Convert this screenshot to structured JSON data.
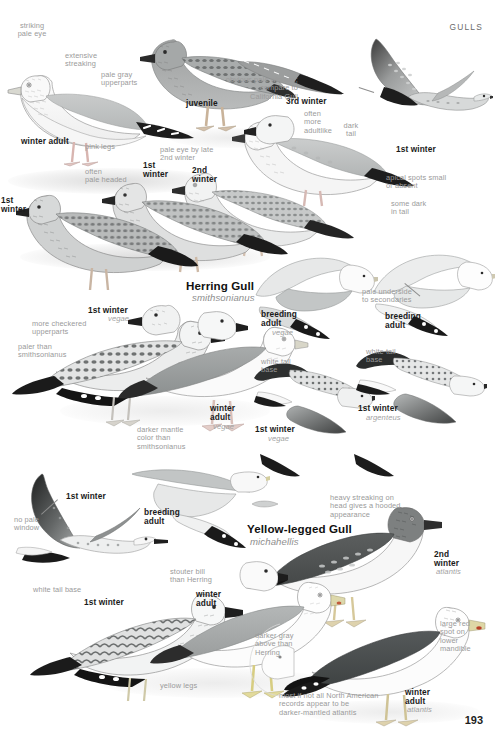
{
  "page": {
    "header": "GULLS",
    "number": "193",
    "background_color": "#ffffff",
    "text_gray": "#9a9a9a",
    "text_black": "#1a1a1a"
  },
  "species": [
    {
      "common_name": "Herring Gull",
      "scientific_name": "smithsonianus",
      "x": 186,
      "y": 279
    },
    {
      "common_name": "Yellow-legged Gull",
      "scientific_name": "michahellis",
      "x": 247,
      "y": 522
    }
  ],
  "plate_labels": [
    {
      "id": "striking-pale-eye",
      "text": "striking\npale eye",
      "x": 32,
      "y": 22,
      "style": "gray",
      "align": "center"
    },
    {
      "id": "extensive-streaking",
      "text": "extensive\nstreaking",
      "x": 65,
      "y": 52,
      "style": "gray",
      "align": "left"
    },
    {
      "id": "pale-gray-upperparts",
      "text": "pale gray\nupperparts",
      "x": 101,
      "y": 71,
      "style": "gray",
      "align": "left"
    },
    {
      "id": "winter-adult-1",
      "text": "winter adult",
      "x": 21,
      "y": 137,
      "style": "bold",
      "align": "left"
    },
    {
      "id": "pink-legs",
      "text": "pink legs",
      "x": 85,
      "y": 143,
      "style": "gray",
      "align": "left"
    },
    {
      "id": "juvenile",
      "text": "juvenile",
      "x": 186,
      "y": 99,
      "style": "bold",
      "align": "left"
    },
    {
      "id": "third-winter",
      "text": "3rd winter",
      "x": 286,
      "y": 97,
      "style": "bold",
      "align": "left"
    },
    {
      "id": "often-more-adultlike",
      "text": "often\nmore\nadultlike",
      "x": 304,
      "y": 110,
      "style": "gray",
      "align": "left"
    },
    {
      "id": "obvious-pale-window",
      "text": "obvious pale window;\ncompare to\nCalifornia Gull",
      "x": 298,
      "y": 76,
      "style": "gray",
      "align": "right"
    },
    {
      "id": "dark-tail",
      "text": "dark\ntail",
      "x": 351,
      "y": 122,
      "style": "gray",
      "align": "center"
    },
    {
      "id": "first-winter-flight-top",
      "text": "1st winter",
      "x": 396,
      "y": 145,
      "style": "bold",
      "align": "left"
    },
    {
      "id": "apical-spots",
      "text": "apical spots small\nor absent",
      "x": 386,
      "y": 174,
      "style": "gray",
      "align": "left"
    },
    {
      "id": "some-dark-in-tail",
      "text": "some dark\nin tail",
      "x": 391,
      "y": 200,
      "style": "gray",
      "align": "left"
    },
    {
      "id": "pale-eye-by-late",
      "text": "pale eye by late\n2nd winter",
      "x": 160,
      "y": 146,
      "style": "gray",
      "align": "left"
    },
    {
      "id": "first-winter-b",
      "text": "1st\nwinter",
      "x": 143,
      "y": 161,
      "style": "bold",
      "align": "left"
    },
    {
      "id": "second-winter-b",
      "text": "2nd\nwinter",
      "x": 192,
      "y": 166,
      "style": "bold",
      "align": "left"
    },
    {
      "id": "often-pale-headed",
      "text": "often\npale headed",
      "x": 85,
      "y": 168,
      "style": "gray",
      "align": "left"
    },
    {
      "id": "first-winter-left",
      "text": "1st\nwinter",
      "x": 1,
      "y": 196,
      "style": "bold",
      "align": "left"
    },
    {
      "id": "first-winter-vegae-a",
      "text": "1st winter",
      "x": 88,
      "y": 306,
      "style": "bold",
      "align": "left"
    },
    {
      "id": "vegae-a",
      "text": "vegae",
      "x": 108,
      "y": 315,
      "style": "sci",
      "align": "left"
    },
    {
      "id": "more-checkered",
      "text": "more checkered\nupperparts",
      "x": 32,
      "y": 320,
      "style": "gray",
      "align": "left"
    },
    {
      "id": "paler-than-smith",
      "text": "paler than\nsmithsonianus",
      "x": 18,
      "y": 343,
      "style": "gray",
      "align": "left"
    },
    {
      "id": "winter-adult-vegae",
      "text": "winter\nadult",
      "x": 210,
      "y": 404,
      "style": "bold",
      "align": "left"
    },
    {
      "id": "vegae-b",
      "text": "vegae",
      "x": 213,
      "y": 423,
      "style": "sci",
      "align": "left"
    },
    {
      "id": "darker-mantle-color",
      "text": "darker mantle\ncolor than\nsmithsonianus",
      "x": 137,
      "y": 426,
      "style": "gray",
      "align": "left"
    },
    {
      "id": "breeding-adult-vegae",
      "text": "breeding\nadult",
      "x": 261,
      "y": 310,
      "style": "bold",
      "align": "left"
    },
    {
      "id": "vegae-c",
      "text": "vegae",
      "x": 272,
      "y": 329,
      "style": "sci",
      "align": "left"
    },
    {
      "id": "pale-underside-sec",
      "text": "pale underside\nto secondaries",
      "x": 362,
      "y": 288,
      "style": "gray",
      "align": "left"
    },
    {
      "id": "breeding-adult-argenteus",
      "text": "breeding\nadult",
      "x": 385,
      "y": 312,
      "style": "bold",
      "align": "left"
    },
    {
      "id": "white-tail-base-a",
      "text": "white tail\nbase",
      "x": 261,
      "y": 358,
      "style": "gray",
      "align": "left"
    },
    {
      "id": "first-winter-vegae-b",
      "text": "1st winter",
      "x": 255,
      "y": 425,
      "style": "bold",
      "align": "left"
    },
    {
      "id": "vegae-d",
      "text": "vegae",
      "x": 268,
      "y": 435,
      "style": "sci",
      "align": "left"
    },
    {
      "id": "white-tail-base-b",
      "text": "white tail\nbase",
      "x": 366,
      "y": 348,
      "style": "gray",
      "align": "left"
    },
    {
      "id": "first-winter-argenteus",
      "text": "1st winter",
      "x": 358,
      "y": 404,
      "style": "bold",
      "align": "left"
    },
    {
      "id": "argenteus",
      "text": "argenteus",
      "x": 366,
      "y": 414,
      "style": "sci",
      "align": "left"
    },
    {
      "id": "first-winter-flight-low",
      "text": "1st winter",
      "x": 66,
      "y": 492,
      "style": "bold",
      "align": "left"
    },
    {
      "id": "no-pale-window",
      "text": "no pale\nwindow",
      "x": 14,
      "y": 516,
      "style": "gray",
      "align": "left"
    },
    {
      "id": "white-tail-base-c",
      "text": "white tail base",
      "x": 33,
      "y": 586,
      "style": "gray",
      "align": "left"
    },
    {
      "id": "breeding-adult-ylg",
      "text": "breeding\nadult",
      "x": 144,
      "y": 508,
      "style": "bold",
      "align": "left"
    },
    {
      "id": "heavy-streaking-head",
      "text": "heavy streaking on\nhead gives a hooded\nappearance",
      "x": 330,
      "y": 494,
      "style": "gray",
      "align": "left"
    },
    {
      "id": "second-winter-atlantis",
      "text": "2nd\nwinter",
      "x": 434,
      "y": 550,
      "style": "bold",
      "align": "left"
    },
    {
      "id": "atlantis-a",
      "text": "atlantis",
      "x": 436,
      "y": 568,
      "style": "sci",
      "align": "left"
    },
    {
      "id": "stouter-bill",
      "text": "stouter bill\nthan Herring",
      "x": 170,
      "y": 568,
      "style": "gray",
      "align": "left"
    },
    {
      "id": "first-winter-ylg",
      "text": "1st winter",
      "x": 84,
      "y": 598,
      "style": "bold",
      "align": "left"
    },
    {
      "id": "winter-adult-ylg-a",
      "text": "winter\nadult",
      "x": 196,
      "y": 590,
      "style": "bold",
      "align": "left"
    },
    {
      "id": "yellow-legs",
      "text": "yellow legs",
      "x": 160,
      "y": 682,
      "style": "gray",
      "align": "left"
    },
    {
      "id": "darker-gray-above",
      "text": "darker gray\nabove than\nHerring",
      "x": 255,
      "y": 632,
      "style": "gray",
      "align": "left"
    },
    {
      "id": "large-red-spot",
      "text": "large red\nspot on\nlower\nmandible",
      "x": 440,
      "y": 620,
      "style": "gray",
      "align": "left"
    },
    {
      "id": "winter-adult-atlantis",
      "text": "winter\nadult",
      "x": 405,
      "y": 688,
      "style": "bold",
      "align": "left"
    },
    {
      "id": "atlantis-b",
      "text": "atlantis",
      "x": 407,
      "y": 706,
      "style": "sci",
      "align": "left"
    },
    {
      "id": "most-if-not-all",
      "text": "most if not all North American\nrecords appear to be\ndarker-mantled atlantis",
      "x": 279,
      "y": 692,
      "style": "gray",
      "align": "left"
    }
  ],
  "leader_lines": [
    {
      "id": "leader-pale-window",
      "x": 359,
      "y": 87,
      "length": 16,
      "angle": 18
    },
    {
      "id": "leader-pale-under",
      "x": 405,
      "y": 283,
      "length": 20,
      "angle": 40
    },
    {
      "id": "leader-no-window",
      "x": 41,
      "y": 514,
      "length": 22,
      "angle": -42
    }
  ]
}
